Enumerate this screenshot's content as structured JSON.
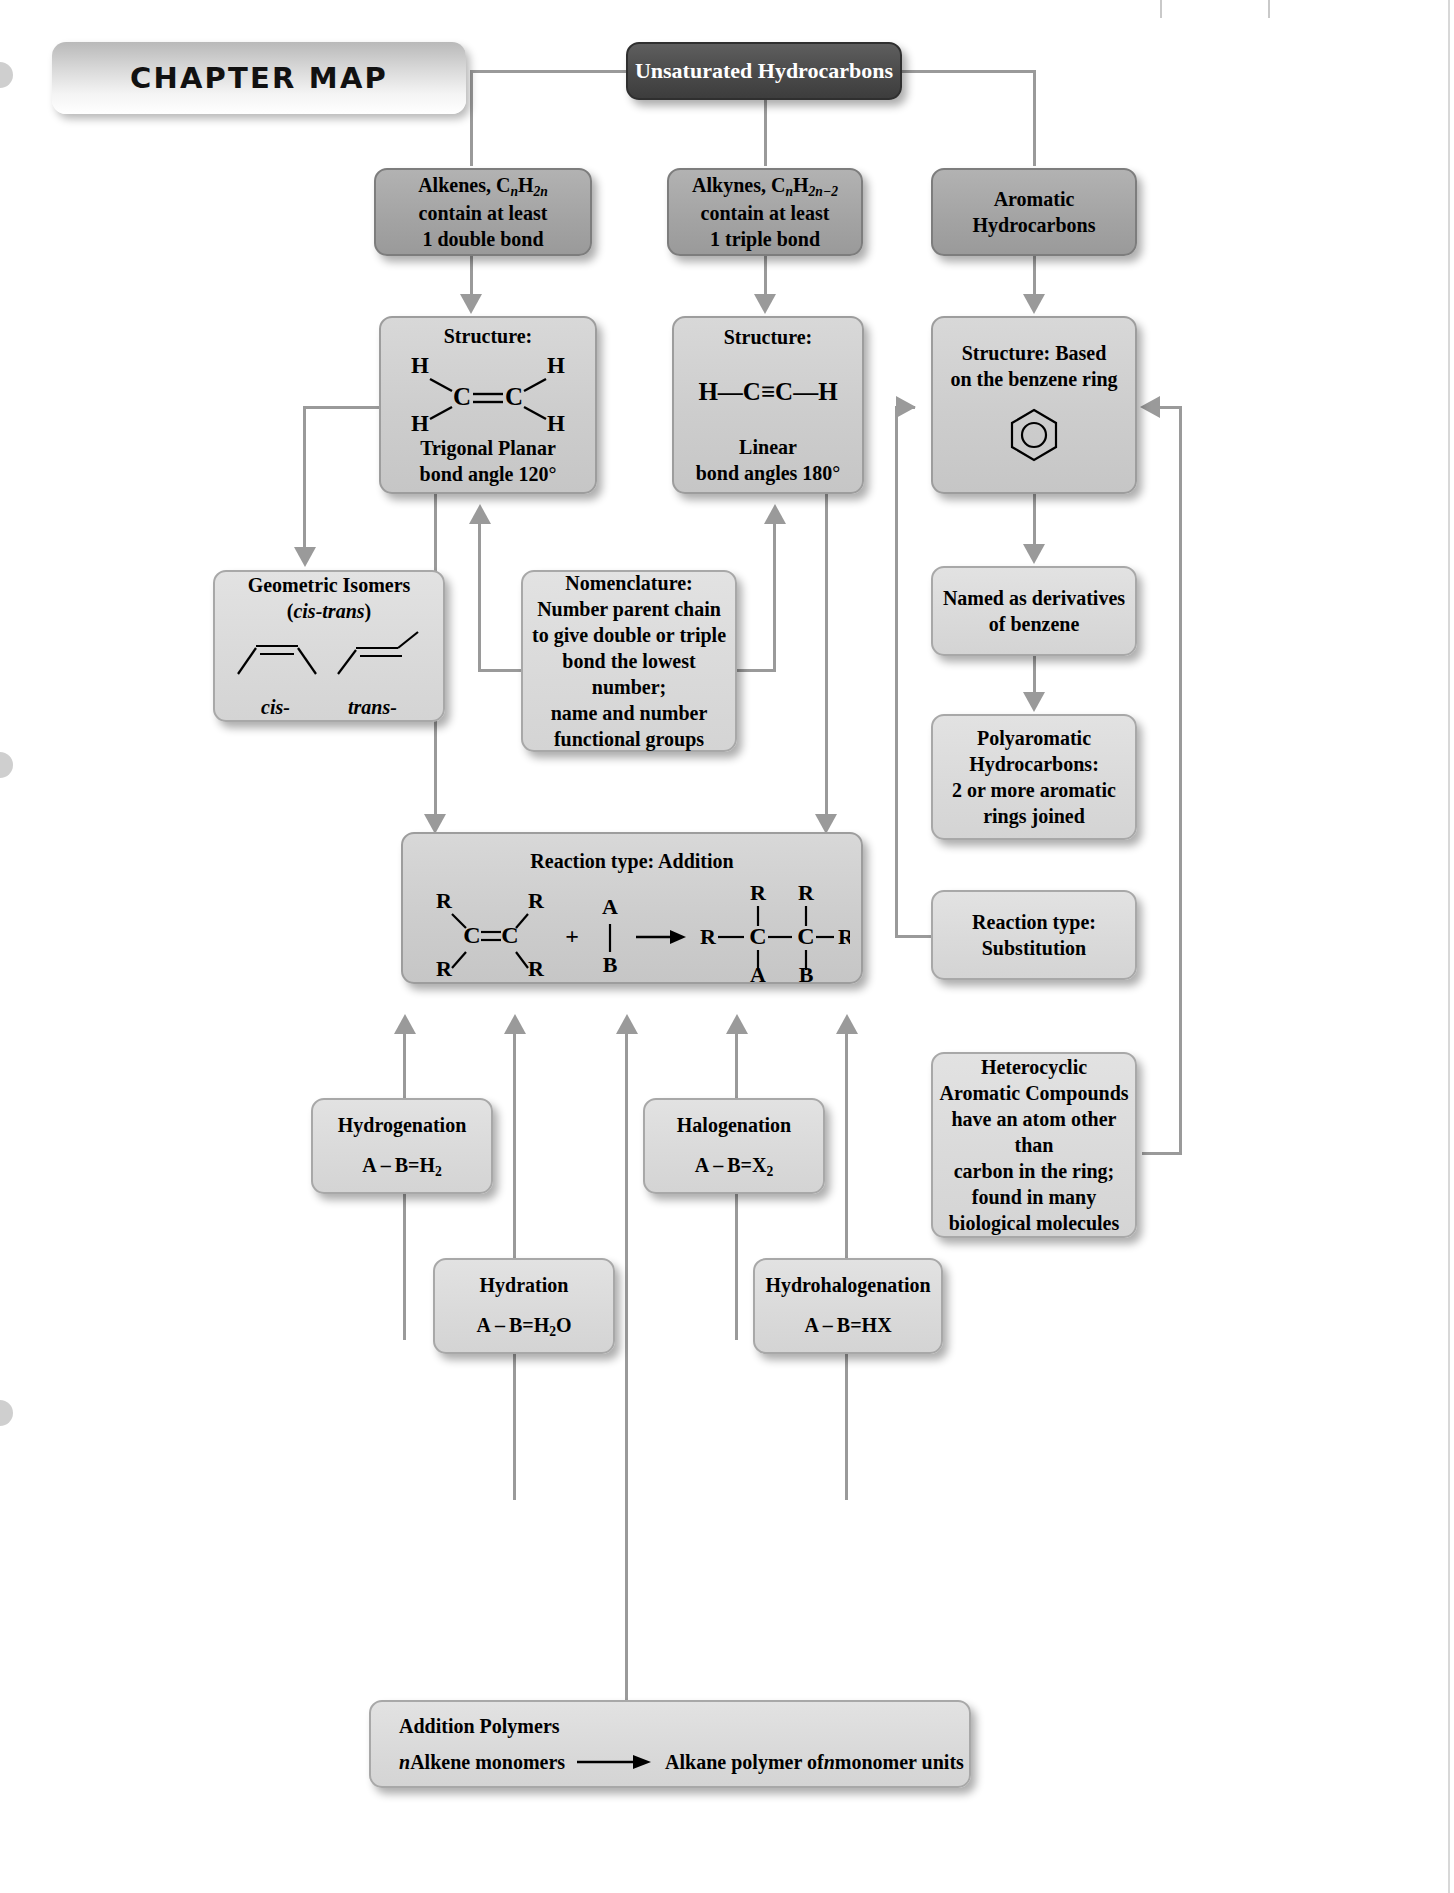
{
  "banner": {
    "label": "CHAPTER MAP"
  },
  "nodes": {
    "root": {
      "label": "Unsaturated Hydrocarbons"
    },
    "alkenes": {
      "formula_pre": "Alkenes, C",
      "formula_n": "n",
      "formula_h": "H",
      "formula_sub": "2n",
      "line2": "contain at least",
      "line3": "1 double bond"
    },
    "alkynes": {
      "formula_pre": "Alkynes, C",
      "formula_n": "n",
      "formula_h": "H",
      "formula_sub": "2n−2",
      "line2": "contain at least",
      "line3": "1 triple bond"
    },
    "aromatic": {
      "line1": "Aromatic",
      "line2": "Hydrocarbons"
    },
    "alkene_structure": {
      "title": "Structure:",
      "atom_h": "H",
      "atom_c": "C",
      "geometry": "Trigonal Planar",
      "angle": "bond angle 120°"
    },
    "alkyne_structure": {
      "title": "Structure:",
      "formula": "H—C≡C—H",
      "geometry": "Linear",
      "angle": "bond angles 180°"
    },
    "aromatic_structure": {
      "line1": "Structure: Based",
      "line2": "on the benzene ring",
      "icon": "benzene-ring"
    },
    "geometric_isomers": {
      "title": "Geometric Isomers",
      "subtitle_open": "(",
      "subtitle_italic": "cis-trans",
      "subtitle_close": ")",
      "label_cis": "cis-",
      "label_trans": "trans-"
    },
    "nomenclature": {
      "line1": "Nomenclature:",
      "line2": "Number parent chain",
      "line3": "to give double or triple",
      "line4": "bond the lowest number;",
      "line5": "name and number",
      "line6": "functional groups"
    },
    "benzene_derivatives": {
      "line1": "Named as derivatives",
      "line2": "of benzene"
    },
    "polyaromatic": {
      "line1": "Polyaromatic",
      "line2": "Hydrocarbons:",
      "line3": "2 or more aromatic",
      "line4": "rings joined"
    },
    "substitution": {
      "line1": "Reaction type:",
      "line2": "Substitution"
    },
    "heterocyclic": {
      "line1": "Heterocyclic",
      "line2": "Aromatic Compounds",
      "line3": "have an atom other than",
      "line4": "carbon in the ring;",
      "line5": "found in many",
      "line6": "biological molecules"
    },
    "addition": {
      "title": "Reaction type: Addition",
      "r": "R",
      "c": "C",
      "a": "A",
      "b": "B",
      "plus": "+"
    },
    "hydrogenation": {
      "title": "Hydrogenation",
      "eq_pre": "A – B=H",
      "eq_sub": "2"
    },
    "halogenation": {
      "title": "Halogenation",
      "eq_pre": "A – B=X",
      "eq_sub": "2"
    },
    "hydration": {
      "title": "Hydration",
      "eq_pre": "A – B=H",
      "eq_sub": "2",
      "eq_post": "O"
    },
    "hydrohalogenation": {
      "title": "Hydrohalogenation",
      "eq_pre": "A – B=HX",
      "eq_sub": "",
      "eq_post": ""
    },
    "addition_polymers": {
      "title": "Addition Polymers",
      "eq_n1": "n",
      "eq_part1": " Alkene monomers",
      "eq_part2": "Alkane polymer of ",
      "eq_n2": "n",
      "eq_part3": " monomer units"
    }
  }
}
